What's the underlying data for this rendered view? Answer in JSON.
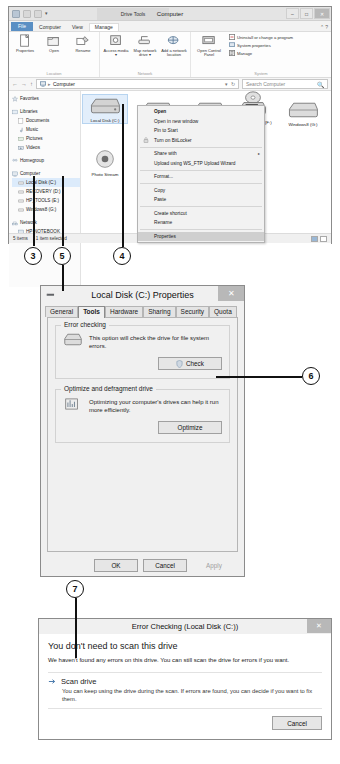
{
  "explorer": {
    "title": "Computer",
    "contextual_tab_title": "Drive Tools",
    "quick_access": {
      "caret": "▾"
    },
    "window_buttons": {
      "minimize": "–",
      "maximize": "□",
      "close": "✕"
    },
    "ribbon_help": "⌃  ?",
    "tabs": [
      {
        "label": "File",
        "type": "file"
      },
      {
        "label": "Computer",
        "type": "normal"
      },
      {
        "label": "View",
        "type": "normal"
      },
      {
        "label": "Manage",
        "type": "active"
      }
    ],
    "ribbon_groups": [
      {
        "label": "Location",
        "items": [
          {
            "label": "Properties",
            "icon": "properties-icon"
          },
          {
            "label": "Open",
            "icon": "open-icon"
          },
          {
            "label": "Rename",
            "icon": "rename-icon"
          }
        ]
      },
      {
        "label": "Network",
        "items": [
          {
            "label": "Access media ▾",
            "icon": "access-media-icon"
          },
          {
            "label": "Map network drive ▾",
            "icon": "map-network-drive-icon"
          },
          {
            "label": "Add a network location",
            "icon": "add-network-location-icon"
          }
        ]
      },
      {
        "label": "System",
        "items": [
          {
            "label": "Open Control Panel",
            "icon": "control-panel-icon"
          }
        ],
        "small_items": [
          {
            "label": "Uninstall or change a program",
            "icon": "uninstall-icon"
          },
          {
            "label": "System properties",
            "icon": "system-properties-icon"
          },
          {
            "label": "Manage",
            "icon": "manage-icon"
          }
        ]
      }
    ],
    "address_bar": {
      "back": "←",
      "forward": "→",
      "up": "↑",
      "computer_icon": "computer-icon",
      "path": "Computer",
      "separator": "▸",
      "dropdown": "▾",
      "refresh": "↻",
      "search_placeholder": "Search Computer",
      "search_icon": "🔍"
    },
    "nav_pane": [
      {
        "label": "Favorites",
        "icon": "favorites-icon",
        "indent": 0
      },
      {
        "label": "",
        "icon": "",
        "indent": 0,
        "gap": true
      },
      {
        "label": "Libraries",
        "icon": "libraries-icon",
        "indent": 0
      },
      {
        "label": "Documents",
        "icon": "documents-icon",
        "indent": 1
      },
      {
        "label": "Music",
        "icon": "music-icon",
        "indent": 1
      },
      {
        "label": "Pictures",
        "icon": "pictures-icon",
        "indent": 1
      },
      {
        "label": "Videos",
        "icon": "videos-icon",
        "indent": 1
      },
      {
        "label": "",
        "icon": "",
        "indent": 0,
        "gap": true
      },
      {
        "label": "Homegroup",
        "icon": "homegroup-icon",
        "indent": 0
      },
      {
        "label": "",
        "icon": "",
        "indent": 0,
        "gap": true
      },
      {
        "label": "Computer",
        "icon": "computer-icon",
        "indent": 0
      },
      {
        "label": "Local Disk (C:)",
        "icon": "drive-icon",
        "indent": 1
      },
      {
        "label": "RECOVERY (D:)",
        "icon": "drive-icon",
        "indent": 1
      },
      {
        "label": "HP_TOOLS (E:)",
        "icon": "drive-icon",
        "indent": 1
      },
      {
        "label": "Windows8 (G:)",
        "icon": "drive-icon",
        "indent": 1
      },
      {
        "label": "",
        "icon": "",
        "indent": 0,
        "gap": true
      },
      {
        "label": "Network",
        "icon": "network-icon",
        "indent": 0
      },
      {
        "label": "HP-NOTEBOOK",
        "icon": "pc-icon",
        "indent": 1
      }
    ],
    "drives": [
      {
        "label": "Local Disk (C:)",
        "icon": "hard-drive-icon",
        "selected": true,
        "x": 2,
        "y": 4
      },
      {
        "label": "",
        "icon": "hard-drive-icon",
        "selected": false,
        "x": 54,
        "y": 8
      },
      {
        "label": "",
        "icon": "hard-drive-icon",
        "selected": false,
        "x": 106,
        "y": 8
      },
      {
        "label": "DVD RW Drive (F:)",
        "icon": "dvd-drive-icon",
        "selected": false,
        "x": 152,
        "y": 2
      },
      {
        "label": "Windows8 (G:)",
        "icon": "hard-drive-icon",
        "selected": false,
        "x": 202,
        "y": 8
      },
      {
        "label": "Photo Stream",
        "icon": "photo-stream-icon",
        "selected": false,
        "x": 2,
        "y": 58
      }
    ],
    "context_menu": [
      {
        "label": "Open",
        "bold": true
      },
      {
        "label": "Open in new window"
      },
      {
        "label": "Pin to Start"
      },
      {
        "label": "Turn on BitLocker",
        "icon": "bitlocker-icon"
      },
      {
        "separator": true
      },
      {
        "label": "Share with",
        "submenu": "▸"
      },
      {
        "label": "Upload using WS_FTP Upload Wizard"
      },
      {
        "separator": true
      },
      {
        "label": "Format..."
      },
      {
        "separator": true
      },
      {
        "label": "Copy"
      },
      {
        "label": "Paste"
      },
      {
        "separator": true
      },
      {
        "label": "Create shortcut"
      },
      {
        "label": "Rename"
      },
      {
        "separator": true
      },
      {
        "label": "Properties",
        "highlighted": true
      }
    ],
    "status_bar": {
      "items": "5 items",
      "selection": "1 item selected"
    }
  },
  "properties_dialog": {
    "title": "Local Disk (C:) Properties",
    "system_icon": "➖",
    "close": "✕",
    "tabs": [
      {
        "label": "General",
        "active": false
      },
      {
        "label": "Tools",
        "active": true
      },
      {
        "label": "Hardware",
        "active": false
      },
      {
        "label": "Sharing",
        "active": false
      },
      {
        "label": "Security",
        "active": false
      },
      {
        "label": "Quota",
        "active": false
      }
    ],
    "error_checking": {
      "legend": "Error checking",
      "description": "This option will check the drive for file system errors.",
      "icon": "drive-check-icon",
      "button": "Check",
      "button_icon": "shield-icon"
    },
    "optimize": {
      "legend": "Optimize and defragment drive",
      "description": "Optimizing your computer's drives can help it run more efficiently.",
      "icon": "defrag-icon",
      "button": "Optimize"
    },
    "footer_buttons": [
      {
        "label": "OK",
        "disabled": false
      },
      {
        "label": "Cancel",
        "disabled": false
      },
      {
        "label": "Apply",
        "disabled": true
      }
    ]
  },
  "error_checking_dialog": {
    "title": "Error Checking (Local Disk (C:))",
    "close": "✕",
    "heading": "You don't need to scan this drive",
    "paragraph": "We haven't found any errors on this drive. You can still scan the drive for errors if you want.",
    "option": {
      "icon": "shield-arrow-icon",
      "title": "Scan drive",
      "description": "You can keep using the drive during the scan. If errors are found, you can decide if you want to fix them."
    },
    "footer_buttons": [
      {
        "label": "Cancel"
      }
    ]
  },
  "callouts": [
    {
      "number": "3"
    },
    {
      "number": "5"
    },
    {
      "number": "4"
    },
    {
      "number": "6"
    },
    {
      "number": "7"
    }
  ]
}
